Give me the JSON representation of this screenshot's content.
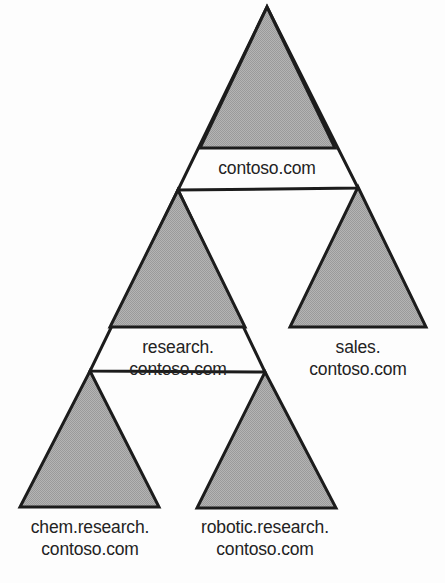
{
  "diagram": {
    "type": "hierarchy-triangle-tree",
    "background_color": "#fdfdfd",
    "fill_color": "#a9a9a9",
    "stroke_color": "#1c1c1c",
    "text_color": "#232323",
    "nodes": [
      {
        "id": "root",
        "label_lines": [
          "contoso.com"
        ],
        "full_name": "contoso.com",
        "level": 0,
        "parent": null,
        "label_x": 267,
        "label_y": 157
      },
      {
        "id": "research",
        "label_lines": [
          "research.",
          "contoso.com"
        ],
        "full_name": "research.contoso.com",
        "level": 1,
        "parent": "root",
        "label_x": 178,
        "label_y": 336
      },
      {
        "id": "sales",
        "label_lines": [
          "sales.",
          "contoso.com"
        ],
        "full_name": "sales.contoso.com",
        "level": 1,
        "parent": "root",
        "label_x": 358,
        "label_y": 336
      },
      {
        "id": "chem",
        "label_lines": [
          "chem.research.",
          "contoso.com"
        ],
        "full_name": "chem.research.contoso.com",
        "level": 2,
        "parent": "research",
        "label_x": 90,
        "label_y": 516
      },
      {
        "id": "robotic",
        "label_lines": [
          "robotic.research.",
          "contoso.com"
        ],
        "full_name": "robotic.research.contoso.com",
        "level": 2,
        "parent": "research",
        "label_x": 265,
        "label_y": 516
      }
    ]
  },
  "labels": {
    "root": {
      "line1": "contoso.com",
      "line2": ""
    },
    "research": {
      "line1": "research.",
      "line2": "contoso.com"
    },
    "sales": {
      "line1": "sales.",
      "line2": "contoso.com"
    },
    "chem": {
      "line1": "chem.research.",
      "line2": "contoso.com"
    },
    "robotic": {
      "line1": "robotic.research.",
      "line2": "contoso.com"
    }
  }
}
